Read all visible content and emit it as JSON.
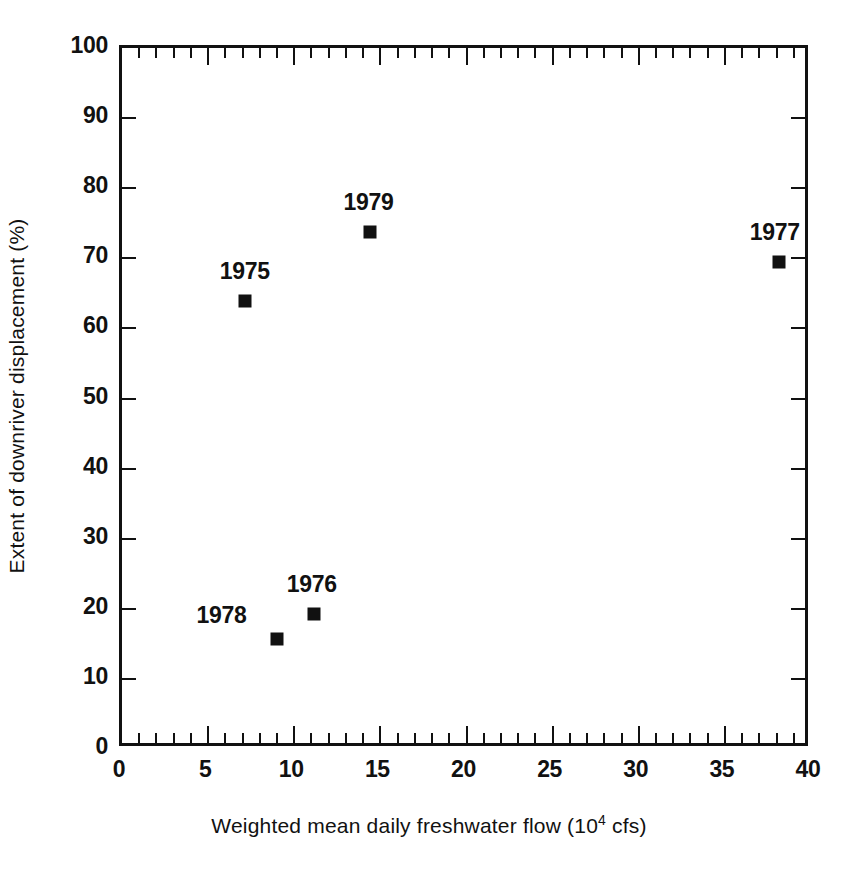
{
  "chart_data": {
    "type": "scatter",
    "title": "",
    "xlabel_text": "Weighted mean daily freshwater flow (10",
    "xlabel_exponent": "4",
    "xlabel_tail": " cfs)",
    "xlabel_full": "Weighted mean daily freshwater flow (10^4 cfs)",
    "ylabel": "Extent of downriver displacement (%)",
    "xlim": [
      0,
      40
    ],
    "ylim": [
      0,
      100
    ],
    "x_major_ticks": [
      0,
      5,
      10,
      15,
      20,
      25,
      30,
      35,
      40
    ],
    "x_minor_tick_step": 1,
    "y_major_ticks": [
      0,
      10,
      20,
      30,
      40,
      50,
      60,
      70,
      80,
      90,
      100
    ],
    "x_tick_labels": [
      "0",
      "5",
      "10",
      "15",
      "20",
      "25",
      "30",
      "35",
      "40"
    ],
    "y_tick_labels": [
      "0",
      "10",
      "20",
      "30",
      "40",
      "50",
      "60",
      "70",
      "80",
      "90",
      "100"
    ],
    "grid": false,
    "legend": false,
    "marker": "filled-square",
    "marker_color": "#111111",
    "points": [
      {
        "label": "1975",
        "x": 7.3,
        "y": 63.5,
        "label_dx": 0,
        "label_dy": -30
      },
      {
        "label": "1979",
        "x": 14.6,
        "y": 73.3,
        "label_dx": -2,
        "label_dy": -30
      },
      {
        "label": "1977",
        "x": 38.3,
        "y": 69.1,
        "label_dx": -4,
        "label_dy": -30
      },
      {
        "label": "1976",
        "x": 11.3,
        "y": 18.9,
        "label_dx": -2,
        "label_dy": -30
      },
      {
        "label": "1978",
        "x": 9.2,
        "y": 15.2,
        "label_dx": -56,
        "label_dy": -24
      }
    ]
  },
  "figure": {
    "background_color": "#ffffff",
    "axis_color": "#111111"
  }
}
